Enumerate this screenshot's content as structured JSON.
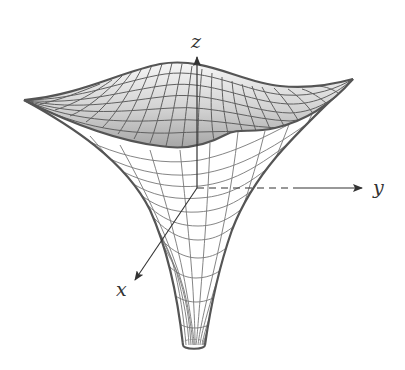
{
  "figure": {
    "axes": {
      "x": {
        "label": "x"
      },
      "y": {
        "label": "y"
      },
      "z": {
        "label": "z"
      }
    },
    "colors": {
      "background": "#ffffff",
      "mesh_line": "#6e6e6e",
      "outline": "#555555",
      "inner_surface_light": "#f4f4f4",
      "inner_surface_dark": "#a9a9a9",
      "outer_surface": "#ffffff",
      "axis": "#333333"
    }
  }
}
